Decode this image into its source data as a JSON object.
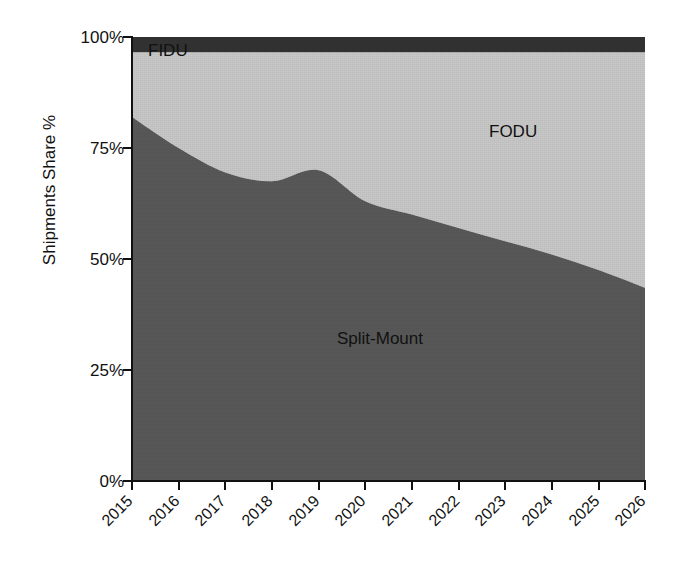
{
  "chart_data": {
    "type": "area",
    "title": "",
    "subtitle": "",
    "xlabel": "",
    "ylabel": "Shipments Share %",
    "stacked": true,
    "normalized_percent": true,
    "grid": false,
    "legend_position": "inline-annotations",
    "xlim": [
      2015,
      2026
    ],
    "ylim": [
      0,
      100
    ],
    "x": [
      2015,
      2016,
      2017,
      2018,
      2019,
      2020,
      2021,
      2022,
      2023,
      2024,
      2025,
      2026
    ],
    "categories": [
      "2015",
      "2016",
      "2017",
      "2018",
      "2019",
      "2020",
      "2021",
      "2022",
      "2023",
      "2024",
      "2025",
      "2026"
    ],
    "x_tick_labels": [
      "2015",
      "2016",
      "2017",
      "2018",
      "2019",
      "2020",
      "2021",
      "2022",
      "2023",
      "2024",
      "2025",
      "2026"
    ],
    "y_tick_labels": [
      "0%",
      "25%",
      "50%",
      "75%",
      "100%"
    ],
    "y_tick_values": [
      0,
      25,
      50,
      75,
      100
    ],
    "series": [
      {
        "name": "Split-Mount",
        "color": "#595959",
        "label_text": "Split-Mount",
        "values": [
          82.0,
          75.0,
          69.5,
          67.5,
          70.0,
          63.0,
          60.0,
          57.0,
          54.0,
          51.0,
          47.5,
          43.5
        ]
      },
      {
        "name": "FODU",
        "color": "#c9c9c9",
        "label_text": "FODU",
        "values": [
          14.5,
          21.5,
          27.0,
          29.0,
          26.5,
          33.5,
          36.5,
          39.5,
          42.5,
          45.5,
          49.0,
          53.0
        ]
      },
      {
        "name": "FIDU",
        "color": "#333333",
        "label_text": "FIDU",
        "values": [
          3.5,
          3.5,
          3.5,
          3.5,
          3.5,
          3.5,
          3.5,
          3.5,
          3.5,
          3.5,
          3.5,
          3.5
        ]
      }
    ],
    "cumulative_boundaries": {
      "split_mount_top": [
        82.0,
        75.0,
        69.5,
        67.5,
        70.0,
        63.0,
        60.0,
        57.0,
        54.0,
        51.0,
        47.5,
        43.5
      ],
      "fodu_top": [
        96.5,
        96.5,
        96.5,
        96.5,
        96.5,
        96.5,
        96.5,
        96.5,
        96.5,
        96.5,
        96.5,
        96.5
      ]
    },
    "annotations": [
      {
        "text": "FIDU",
        "x": 2015.4,
        "y": 95.0
      },
      {
        "text": "FODU",
        "x": 2023.4,
        "y": 80.0
      },
      {
        "text": "Split-Mount",
        "x": 2019.8,
        "y": 36.0
      }
    ]
  },
  "axis": {
    "y_title": "Shipments Share %",
    "y_ticks": [
      {
        "label": "100%",
        "value": 100
      },
      {
        "label": "75%",
        "value": 75
      },
      {
        "label": "50%",
        "value": 50
      },
      {
        "label": "25%",
        "value": 25
      },
      {
        "label": "0%",
        "value": 0
      }
    ],
    "x_ticks": [
      {
        "label": "2015"
      },
      {
        "label": "2016"
      },
      {
        "label": "2017"
      },
      {
        "label": "2018"
      },
      {
        "label": "2019"
      },
      {
        "label": "2020"
      },
      {
        "label": "2021"
      },
      {
        "label": "2022"
      },
      {
        "label": "2023"
      },
      {
        "label": "2024"
      },
      {
        "label": "2025"
      },
      {
        "label": "2026"
      }
    ]
  },
  "colors": {
    "split_mount": "#595959",
    "fodu": "#c9c9c9",
    "fidu": "#333333",
    "axis": "#111111",
    "background": "#ffffff"
  }
}
